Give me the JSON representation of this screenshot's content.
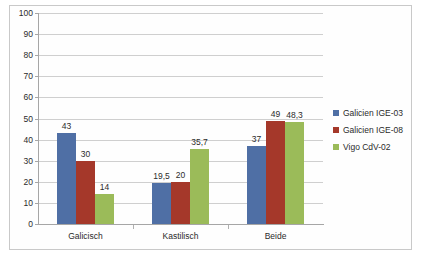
{
  "chart_data": {
    "type": "bar",
    "title": "",
    "subtitle": "",
    "xlabel": "",
    "ylabel": "",
    "ylim": [
      0,
      100
    ],
    "ytick_step": 10,
    "ytick_labels": [
      "0",
      "10",
      "20",
      "30",
      "40",
      "50",
      "60",
      "70",
      "80",
      "90",
      "100"
    ],
    "grid": true,
    "legend_position": "right",
    "categories": [
      "Galicisch",
      "Kastilisch",
      "Beide"
    ],
    "series": [
      {
        "name": "Galicien IGE-03",
        "color": "#4F6FA5",
        "values": [
          43,
          19.5,
          37
        ],
        "value_labels": [
          "43",
          "19,5",
          "37"
        ]
      },
      {
        "name": "Galicien IGE-08",
        "color": "#A5382A",
        "values": [
          30,
          20,
          49
        ],
        "value_labels": [
          "30",
          "20",
          "49"
        ]
      },
      {
        "name": "Vigo CdV-02",
        "color": "#9BBB59",
        "values": [
          14,
          35.7,
          48.3
        ],
        "value_labels": [
          "14",
          "35,7",
          "48,3"
        ]
      }
    ]
  },
  "legend": {
    "items": [
      {
        "label": "Galicien IGE-03"
      },
      {
        "label": "Galicien IGE-08"
      },
      {
        "label": "Vigo CdV-02"
      }
    ]
  },
  "axis": {
    "y_labels": [
      "100",
      "90",
      "80",
      "70",
      "60",
      "50",
      "40",
      "30",
      "20",
      "10",
      "0"
    ],
    "x_labels": [
      "Galicisch",
      "Kastilisch",
      "Beide"
    ]
  }
}
